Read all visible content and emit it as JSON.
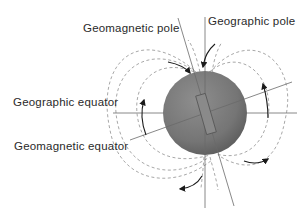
{
  "diagram": {
    "labels": {
      "geomagnetic_pole": "Geomagnetic pole",
      "geographic_pole": "Geographic pole",
      "geographic_equator": "Geographic equator",
      "geomagnetic_equator": "Geomagnetic equator"
    },
    "elements": {
      "earth_sphere": "Earth",
      "bar_magnet": "internal dipole magnet",
      "field_lines": "dashed magnetic field lines",
      "flow_arrows": "field direction arrows"
    },
    "colors": {
      "sphere_fill": "#7d7d7d",
      "field_line": "#a8a8a8",
      "axis_line": "#6a6a6a",
      "text": "#2a2a2a"
    }
  }
}
